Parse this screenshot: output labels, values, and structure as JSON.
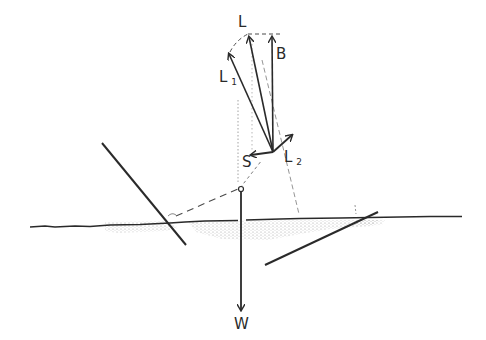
{
  "diagram": {
    "type": "force-vector-diagram",
    "colors": {
      "ink": "#2a2a2a",
      "faint": "#8a8a8a",
      "shading": "#9a9a9a",
      "background": "#ffffff"
    },
    "labels": {
      "L": "L",
      "B": "B",
      "L1_main": "L",
      "L1_sub": "1",
      "L2_main": "L",
      "L2_sub": "2",
      "S": "S",
      "W": "W"
    },
    "vectors": [
      {
        "name": "L",
        "from": [
          273,
          152
        ],
        "to": [
          248,
          34
        ]
      },
      {
        "name": "B",
        "from": [
          273,
          152
        ],
        "to": [
          272,
          34
        ]
      },
      {
        "name": "L1",
        "from": [
          273,
          152
        ],
        "to": [
          228,
          52
        ]
      },
      {
        "name": "L2",
        "from": [
          273,
          152
        ],
        "to": [
          293,
          134
        ]
      },
      {
        "name": "S",
        "from": [
          273,
          152
        ],
        "to": [
          250,
          155
        ]
      },
      {
        "name": "W",
        "from": [
          241,
          189
        ],
        "to": [
          241,
          312
        ]
      }
    ],
    "surface_line": {
      "y": 217,
      "x_start": 30,
      "x_end": 462
    },
    "oars": [
      {
        "from": [
          102,
          143
        ],
        "to": [
          186,
          245
        ]
      },
      {
        "from": [
          265,
          265
        ],
        "to": [
          378,
          212
        ]
      }
    ]
  }
}
